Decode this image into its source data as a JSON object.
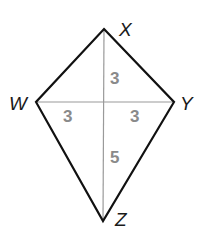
{
  "diagram": {
    "type": "kite",
    "colors": {
      "edge": "#111111",
      "diagonal": "#9a9a9a",
      "length_label": "#8a8a8a",
      "vertex_label": "#1a1a1a"
    },
    "vertices": {
      "X": {
        "label": "X",
        "x": 104,
        "y": 29
      },
      "Y": {
        "label": "Y",
        "x": 174,
        "y": 102
      },
      "Z": {
        "label": "Z",
        "x": 103,
        "y": 221
      },
      "W": {
        "label": "W",
        "x": 36,
        "y": 102
      }
    },
    "segment_lengths": {
      "upper": "3",
      "left": "3",
      "right": "3",
      "lower": "5"
    }
  }
}
